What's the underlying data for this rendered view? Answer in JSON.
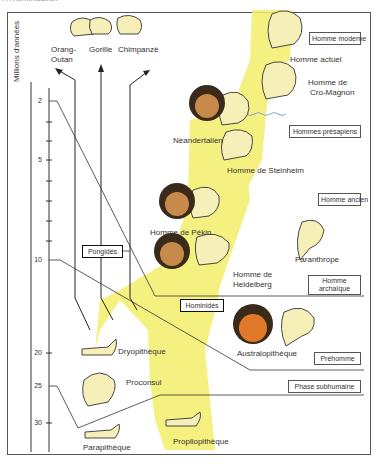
{
  "header": {
    "cut_title": "À l'hominisation"
  },
  "axis": {
    "label": "Millions d'années",
    "ticks": [
      {
        "value": "2",
        "y": 101
      },
      {
        "value": "5",
        "y": 160
      },
      {
        "value": "10",
        "y": 260
      },
      {
        "value": "20",
        "y": 353
      },
      {
        "value": "25",
        "y": 386
      },
      {
        "value": "30",
        "y": 423
      }
    ]
  },
  "apes": [
    {
      "name": "Orang-",
      "name2": "Outan"
    },
    {
      "name": "Gorille"
    },
    {
      "name": "Chimpanzé"
    }
  ],
  "species": {
    "homme_actuel": "Homme actuel",
    "cro_magnon_1": "Homme de",
    "cro_magnon_2": "Cro-Magnon",
    "neandertalien": "Néandertalien",
    "steinheim": "Homme de Steinheim",
    "pekin": "Homme de Pékin",
    "heidelberg_1": "Homme de",
    "heidelberg_2": "Heidelberg",
    "paranthrope": "Paranthrope",
    "australopitheque": "Australopithèque",
    "dryopitheque": "Dryopithèque",
    "proconsul": "Proconsul",
    "parapitheque": "Parapithèque",
    "propliopitheque": "Propliopithèque"
  },
  "categories": {
    "homme_moderne": "Homme moderne",
    "hommes_presapiens": "Hommes présapiens",
    "homme_ancien": "Homme ancien",
    "homme_archaique_1": "Homme",
    "homme_archaique_2": "archaïque",
    "prehomme": "Préhomme",
    "phase_subhumaine": "Phase subhumaine",
    "pongides": "Pongidés",
    "hominides": "Hominidés"
  },
  "colors": {
    "highlight": "#f5f07a",
    "skull": "#f6efb8",
    "face": "#c88a4a",
    "face_aus": "#e07a2a",
    "hair": "#3a2a1a"
  }
}
